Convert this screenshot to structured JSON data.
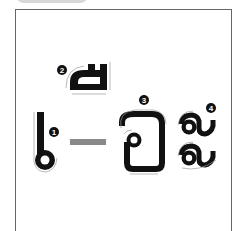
{
  "diagram": {
    "type": "stroke-order",
    "script": "Lao",
    "characters": [
      {
        "id": 1,
        "label": "1",
        "glyph": "ໂ",
        "description": "vertical stroke ending in loop"
      },
      {
        "id": 2,
        "label": "2",
        "glyph": "ີ",
        "description": "upper vowel mark"
      },
      {
        "id": 3,
        "label": "3",
        "glyph": "ອ",
        "description": "rounded rectangle with inner loop"
      },
      {
        "id": 4,
        "label": "4",
        "glyph": "ະ",
        "description": "two stacked hook shapes"
      }
    ],
    "dash_color": "#888888",
    "stroke_color": "#111111",
    "guide_color": "#999999"
  }
}
